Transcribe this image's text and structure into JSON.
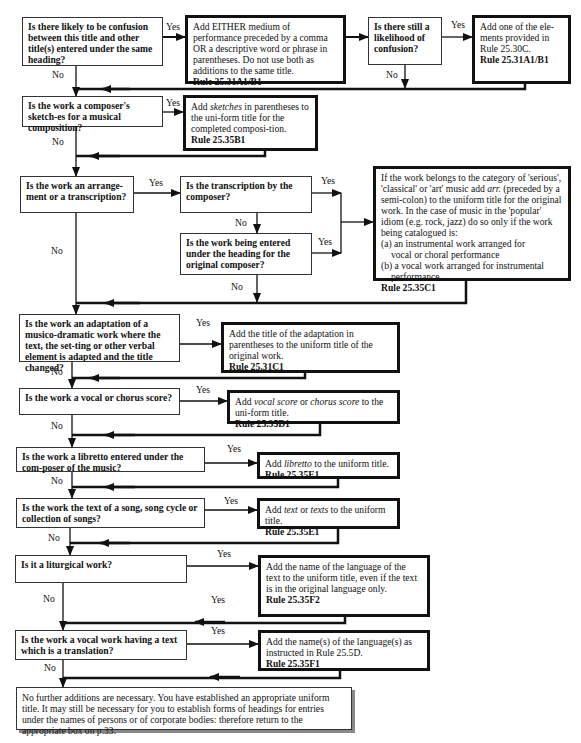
{
  "flowchart": {
    "questions": [
      {
        "id": "q1",
        "text": "Is there likely to be confusion between this title and other title(s) entered under the same heading?"
      },
      {
        "id": "q2",
        "text": "Is there still a likelihood of confusion?"
      },
      {
        "id": "q3",
        "text": "Is the work a composer's sketch-es for a musical composition?"
      },
      {
        "id": "q4",
        "text": "Is the work an arrange-ment or a transcription?"
      },
      {
        "id": "q5",
        "text": "Is the transcription by the composer?"
      },
      {
        "id": "q6",
        "text": "Is the work being entered under the heading for the original composer?"
      },
      {
        "id": "q7",
        "text": "Is the work an adaptation of a musico-dramatic work where the text, the set-ting or other verbal element is adapted and the title changed?"
      },
      {
        "id": "q8",
        "text": "Is the work a vocal or chorus score?"
      },
      {
        "id": "q9",
        "text": "Is the work a libretto entered under the com-poser of the music?"
      },
      {
        "id": "q10",
        "text": "Is the work the text of a song, song cycle or collection of songs?"
      },
      {
        "id": "q11",
        "text": "Is it a liturgical work?"
      },
      {
        "id": "q12",
        "text": "Is the work a vocal work having a text which is a translation?"
      }
    ],
    "actions": {
      "a1": {
        "text": "Add EITHER medium of performance preceded by a comma OR a descriptive word or phrase in parentheses. Do not use both as additions to the same title.",
        "rule": "Rule 25.31A1/B1"
      },
      "a2": {
        "text": "Add one of the ele-ments provided in Rule 25.30C.",
        "rule": "Rule 25.31A1/B1"
      },
      "a3": {
        "pre": "Add ",
        "em": "sketches",
        "post": " in parentheses to the uni-form title for the completed composi-tion.",
        "rule": "Rule 25.35B1"
      },
      "a4": {
        "intro_pre": "If the work belongs to the category of 'serious', 'classical' or 'art' music add ",
        "intro_em": "arr.",
        "intro_post": " (preceded by a semi-colon) to the uniform title for the original work. In the case of music in the 'popular' idiom (e.g. rock, jazz) do so only if the work being catalogued is:",
        "item_a_1": "(a) an instrumental work arranged for",
        "item_a_2": "vocal or choral performance",
        "item_b_1": "(b) a vocal work arranged for instrumental",
        "item_b_2": "performance.",
        "rule": "Rule 25.35C1"
      },
      "a5": {
        "text": "Add the title of the adaptation in parentheses to the uniform title of the original work.",
        "rule": "Rule 25.31C1"
      },
      "a6": {
        "pre": "Add ",
        "em1": "vocal score",
        "mid": " or ",
        "em2": "chorus score",
        "post": " to the uni-form title.",
        "rule": "Rule 25.35D1"
      },
      "a7": {
        "pre": "Add ",
        "em": "libretto",
        "post": " to the uniform title.",
        "rule": "Rule 25.35E1"
      },
      "a8": {
        "pre": "Add ",
        "em1": "text",
        "mid": " or ",
        "em2": "texts",
        "post": " to the uniform title.",
        "rule": "Rule 25.35E1"
      },
      "a9": {
        "text": "Add the name of the language of the text to the uniform title, even if the text is in the original language only.",
        "rule": "Rule 25.35F2"
      },
      "a10": {
        "text": "Add the name(s) of the language(s) as instructed in Rule 25.5D.",
        "rule": "Rule 25.35F1"
      }
    },
    "final": {
      "text": "No further additions are necessary. You have established an appropriate uniform title. It may still be necessary for you to establish forms of headings for entries under the names of persons or of corporate bodies: therefore return to the appropriate box on p.33."
    },
    "labels": {
      "yes": "Yes",
      "no": "No"
    }
  }
}
